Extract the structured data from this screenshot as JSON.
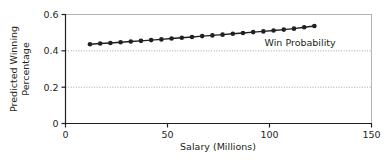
{
  "chart_data": {
    "type": "line",
    "title": "",
    "subtitle": "",
    "xlabel": "Salary (Millions)",
    "ylabel": "Predicted Winning Percentage",
    "ylabel_line1": "Predicted Winning",
    "ylabel_line2": "Percentage",
    "xlim": [
      0,
      150
    ],
    "ylim": [
      0,
      0.6
    ],
    "xticks": [
      0,
      50,
      100,
      150
    ],
    "xtick_labels": [
      "0",
      "50",
      "100",
      "150"
    ],
    "yticks": [
      0,
      0.2,
      0.4,
      0.6
    ],
    "ytick_labels": [
      "0",
      "0.2",
      "0.4",
      "0.6"
    ],
    "grid": "horizontal dotted gridlines at y = 0.2 and y = 0.4",
    "gridlines": [
      0.2,
      0.4
    ],
    "legend": "inline annotation",
    "legend_position": "right of series, inside plot",
    "marker": "filled circle",
    "series": [
      {
        "name": "Win Probability",
        "color": "#231f20",
        "x": [
          12,
          17,
          22,
          27,
          32,
          37,
          42,
          47,
          52,
          57,
          62,
          67,
          72,
          77,
          82,
          87,
          92,
          97,
          102,
          107,
          112,
          117,
          122
        ],
        "values": [
          0.436,
          0.44,
          0.443,
          0.447,
          0.451,
          0.455,
          0.459,
          0.463,
          0.468,
          0.472,
          0.476,
          0.481,
          0.485,
          0.489,
          0.494,
          0.498,
          0.503,
          0.507,
          0.512,
          0.517,
          0.522,
          0.53,
          0.537
        ]
      }
    ],
    "annotations": [
      {
        "text": "Win Probability",
        "x": 115,
        "y": 0.425
      }
    ]
  },
  "colors": {
    "series": "#231f20",
    "axis": "#231f20",
    "frame": "#b5b5b5",
    "grid": "#8c8c8c",
    "background": "#ffffff"
  },
  "axis_titles": {
    "x": "Salary (Millions)",
    "y_line1": "Predicted Winning",
    "y_line2": "Percentage"
  }
}
